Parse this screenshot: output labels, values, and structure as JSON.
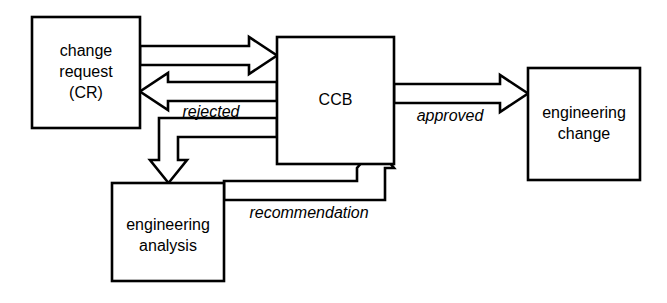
{
  "diagram": {
    "type": "flowchart",
    "background_color": "#ffffff",
    "stroke_color": "#000000",
    "arrow_style": "hollow-block-arrow",
    "nodes": [
      {
        "id": "change-request",
        "lines": [
          "change",
          "request",
          "(CR)"
        ],
        "shape": "rectangle"
      },
      {
        "id": "ccb",
        "lines": [
          "CCB"
        ],
        "shape": "rectangle"
      },
      {
        "id": "engineering-change",
        "lines": [
          "engineering",
          "change"
        ],
        "shape": "rectangle"
      },
      {
        "id": "engineering-analysis",
        "lines": [
          "engineering",
          "analysis"
        ],
        "shape": "rectangle"
      }
    ],
    "edges": [
      {
        "id": "cr-to-ccb",
        "from": "change-request",
        "to": "ccb",
        "label": "",
        "direction": "right"
      },
      {
        "id": "ccb-to-cr-rejected",
        "from": "ccb",
        "to": "change-request",
        "label": "rejected",
        "direction": "left"
      },
      {
        "id": "ccb-to-analysis",
        "from": "ccb",
        "to": "engineering-analysis",
        "label": "",
        "direction": "down"
      },
      {
        "id": "analysis-to-ccb-recommendation",
        "from": "engineering-analysis",
        "to": "ccb",
        "label": "recommendation",
        "direction": "up"
      },
      {
        "id": "ccb-to-engineering-change-approved",
        "from": "ccb",
        "to": "engineering-change",
        "label": "approved",
        "direction": "right"
      }
    ]
  }
}
